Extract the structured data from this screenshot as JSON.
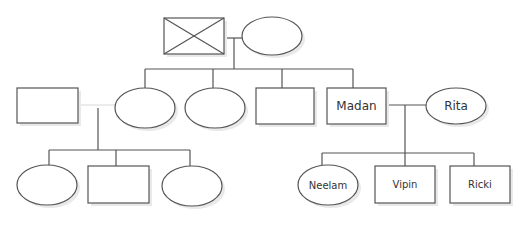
{
  "diagram": {
    "type": "family-tree-genogram",
    "colors": {
      "stroke": "#555555",
      "fill": "#ffffff",
      "text": "#333333"
    },
    "nodes": [
      {
        "id": "g1-male",
        "shape": "crossed-rectangle",
        "label": ""
      },
      {
        "id": "g1-female",
        "shape": "oval",
        "label": ""
      },
      {
        "id": "g2-child1",
        "shape": "oval",
        "label": ""
      },
      {
        "id": "g2-child2",
        "shape": "oval",
        "label": ""
      },
      {
        "id": "g2-child3",
        "shape": "rectangle",
        "label": ""
      },
      {
        "id": "madan",
        "shape": "rectangle",
        "label": "Madan"
      },
      {
        "id": "rita",
        "shape": "oval",
        "label": "Rita"
      },
      {
        "id": "left-parent",
        "shape": "rectangle",
        "label": ""
      },
      {
        "id": "left-child1",
        "shape": "oval",
        "label": ""
      },
      {
        "id": "left-child2",
        "shape": "rectangle",
        "label": ""
      },
      {
        "id": "left-child3",
        "shape": "oval",
        "label": ""
      },
      {
        "id": "neelam",
        "shape": "oval",
        "label": "Neelam"
      },
      {
        "id": "vipin",
        "shape": "rectangle",
        "label": "Vipin"
      },
      {
        "id": "ricki",
        "shape": "rectangle",
        "label": "Ricki"
      }
    ],
    "labels": {
      "madan": "Madan",
      "rita": "Rita",
      "neelam": "Neelam",
      "vipin": "Vipin",
      "ricki": "Ricki"
    }
  }
}
